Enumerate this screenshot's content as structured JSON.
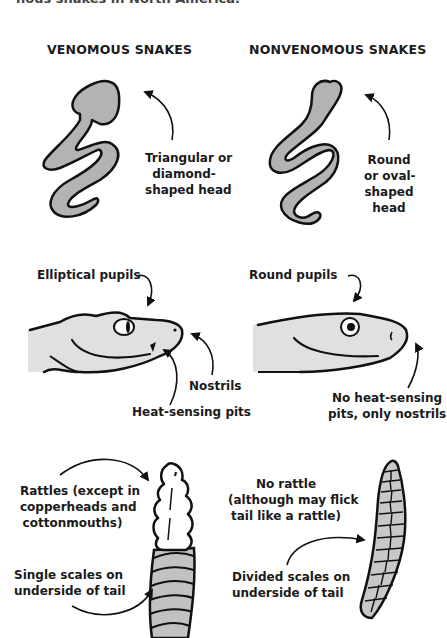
{
  "intro_cutoff_text": "nous snakes in North America.",
  "headings": {
    "venomous": "VENOMOUS SNAKES",
    "nonvenomous": "NONVENOMOUS SNAKES"
  },
  "venomous": {
    "head_shape": "Triangular or diamond-shaped head",
    "head_shape_lines": [
      "Triangular or",
      "diamond-",
      "shaped head"
    ],
    "pupils": "Elliptical pupils",
    "nostrils": "Nostrils",
    "pits": "Heat-sensing pits",
    "rattles_lines": [
      "Rattles (except in",
      "copperheads and",
      "cottonmouths)"
    ],
    "scales_lines": [
      "Single scales on",
      "underside of tail"
    ]
  },
  "nonvenomous": {
    "head_shape_lines": [
      "Round",
      "or oval-",
      "shaped",
      "head"
    ],
    "pupils": "Round pupils",
    "pits_lines": [
      "No heat-sensing",
      "pits, only nostrils"
    ],
    "rattle_lines": [
      "No rattle",
      "(although may flick",
      "tail like a rattle)"
    ],
    "scales_lines": [
      "Divided scales on",
      "underside of tail"
    ]
  },
  "colors": {
    "body_fill_dark": "#b3b3b3",
    "head_fill_light": "#e0e0e0",
    "outline": "#111111"
  }
}
